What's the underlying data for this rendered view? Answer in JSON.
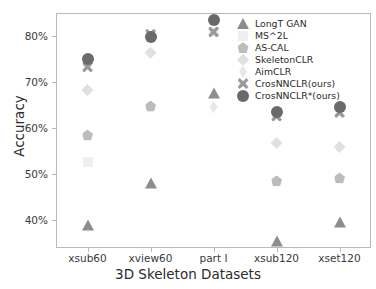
{
  "chart_data": {
    "type": "scatter",
    "title": "",
    "xlabel": "3D Skeleton Datasets",
    "ylabel": "Accuracy",
    "categories": [
      "xsub60",
      "xview60",
      "part I",
      "xsub120",
      "xset120"
    ],
    "ytick_labels": [
      "40%",
      "50%",
      "60%",
      "70%",
      "80%"
    ],
    "ytick_values": [
      40,
      50,
      60,
      70,
      80
    ],
    "ylim": [
      34,
      85
    ],
    "grid": false,
    "legend_position": "upper right",
    "series": [
      {
        "name": "LongT GAN",
        "marker": "triangle",
        "color": "#8d8d8d",
        "values": [
          39.0,
          48.1,
          67.7,
          35.6,
          39.7
        ]
      },
      {
        "name": "MS^2L",
        "marker": "square",
        "color": "#efefef",
        "values": [
          52.6,
          null,
          80.8,
          null,
          null
        ]
      },
      {
        "name": "AS-CAL",
        "marker": "pentagon",
        "color": "#bcbcbc",
        "values": [
          58.5,
          64.8,
          null,
          48.6,
          49.2
        ]
      },
      {
        "name": "SkeletonCLR",
        "marker": "diamond",
        "color": "#e0e0e0",
        "values": [
          68.3,
          76.4,
          null,
          56.8,
          55.9
        ]
      },
      {
        "name": "AimCLR",
        "marker": "thin-diamond",
        "color": "#e8e8e8",
        "values": [
          74.3,
          79.7,
          64.6,
          null,
          null
        ]
      },
      {
        "name": "CrosNNCLR(ours)",
        "marker": "x",
        "color": "#9a9a9a",
        "values": [
          73.3,
          80.4,
          80.9,
          62.6,
          63.4
        ]
      },
      {
        "name": "CrosNNCLR*(ours)",
        "marker": "circle",
        "color": "#6a6a6a",
        "values": [
          75.0,
          79.9,
          83.5,
          63.6,
          64.6
        ]
      }
    ]
  },
  "legend": {
    "items": [
      {
        "label": "LongT GAN"
      },
      {
        "label": "MS^2L"
      },
      {
        "label": "AS-CAL"
      },
      {
        "label": "SkeletonCLR"
      },
      {
        "label": "AimCLR"
      },
      {
        "label": "CrosNNCLR(ours)"
      },
      {
        "label": "CrosNNCLR*(ours)"
      }
    ]
  }
}
